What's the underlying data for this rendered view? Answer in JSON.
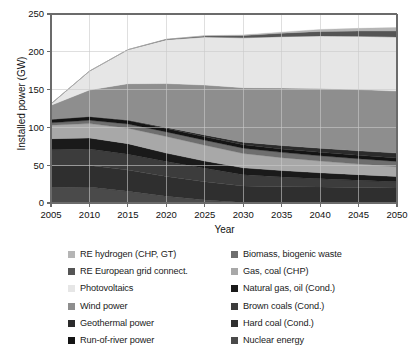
{
  "chart_data": {
    "type": "area",
    "stacked": true,
    "title": "",
    "xlabel": "Year",
    "ylabel": "Installed power (GW)",
    "xlim": [
      2005,
      2050
    ],
    "ylim": [
      0,
      250
    ],
    "yticks": [
      0,
      50,
      100,
      150,
      200,
      250
    ],
    "xticks": [
      2005,
      2010,
      2015,
      2020,
      2025,
      2030,
      2035,
      2040,
      2045,
      2050
    ],
    "grid": true,
    "legend_position": "below",
    "x": [
      2005,
      2010,
      2015,
      2020,
      2025,
      2030,
      2035,
      2040,
      2045,
      2050
    ],
    "series": [
      {
        "name": "Nuclear energy",
        "color": "#4a4a4a",
        "values": [
          20.5,
          21.0,
          15.5,
          9.0,
          4.0,
          0.5,
          0.0,
          0.0,
          0.0,
          0.0
        ]
      },
      {
        "name": "Hard coal (Cond.)",
        "color": "#2f2f2f",
        "values": [
          29.0,
          28.5,
          28.0,
          26.0,
          24.0,
          22.0,
          21.5,
          21.0,
          20.5,
          20.0
        ]
      },
      {
        "name": "Brown coals (Cond.)",
        "color": "#3c3c3c",
        "values": [
          21.0,
          22.0,
          21.0,
          20.0,
          18.0,
          15.0,
          13.0,
          11.0,
          9.5,
          8.0
        ]
      },
      {
        "name": "Natural gas, oil (Cond.)",
        "color": "#1a1a1a",
        "values": [
          14.5,
          14.5,
          14.0,
          11.0,
          9.5,
          9.0,
          8.5,
          8.0,
          7.5,
          7.0
        ]
      },
      {
        "name": "Gas, coal (CHP)",
        "color": "#a8a8a8",
        "values": [
          18.0,
          19.0,
          20.5,
          22.0,
          21.0,
          19.0,
          17.0,
          15.5,
          14.0,
          13.0
        ]
      },
      {
        "name": "Biomass, biogenic waste",
        "color": "#6e6e6e",
        "values": [
          3.0,
          4.5,
          5.5,
          6.0,
          6.5,
          7.0,
          7.0,
          7.0,
          7.0,
          7.0
        ]
      },
      {
        "name": "Run-of-river power",
        "color": "#141414",
        "values": [
          4.5,
          4.5,
          4.5,
          4.5,
          4.5,
          4.5,
          4.5,
          4.5,
          4.5,
          4.5
        ]
      },
      {
        "name": "Geothermal power",
        "color": "#2b2b2b",
        "values": [
          0.2,
          0.4,
          0.8,
          1.5,
          2.5,
          3.5,
          4.5,
          5.5,
          6.0,
          6.5
        ]
      },
      {
        "name": "Wind power",
        "color": "#8e8e8e",
        "values": [
          18.5,
          35.0,
          48.0,
          58.0,
          66.0,
          72.0,
          76.0,
          79.0,
          81.0,
          82.0
        ]
      },
      {
        "name": "Photovoltaics",
        "color": "#e6e6e6",
        "values": [
          2.0,
          25.0,
          45.0,
          58.0,
          63.5,
          66.0,
          68.0,
          69.5,
          70.5,
          71.5
        ]
      },
      {
        "name": "RE European grid connect.",
        "color": "#555555",
        "values": [
          0.0,
          0.0,
          0.0,
          0.5,
          1.5,
          3.0,
          4.5,
          6.0,
          7.0,
          8.0
        ]
      },
      {
        "name": "RE hydrogen (CHP, GT)",
        "color": "#b5b5b5",
        "values": [
          0.0,
          0.0,
          0.0,
          0.0,
          0.3,
          0.8,
          1.5,
          2.5,
          3.5,
          4.5
        ]
      }
    ],
    "totals": [
      151.2,
      174.4,
      202.8,
      216.5,
      221.3,
      218.3,
      222.0,
      225.0,
      227.0,
      228.0
    ]
  },
  "legend": {
    "left_column": [
      {
        "label": "RE hydrogen (CHP, GT)",
        "color": "#b5b5b5"
      },
      {
        "label": "RE European grid connect.",
        "color": "#555555"
      },
      {
        "label": "Photovoltaics",
        "color": "#e6e6e6"
      },
      {
        "label": "Wind power",
        "color": "#8e8e8e"
      },
      {
        "label": "Geothermal power",
        "color": "#2b2b2b"
      },
      {
        "label": "Run-of-river power",
        "color": "#141414"
      }
    ],
    "right_column": [
      {
        "label": "Biomass, biogenic waste",
        "color": "#6e6e6e"
      },
      {
        "label": "Gas, coal (CHP)",
        "color": "#a8a8a8"
      },
      {
        "label": "Natural gas, oil (Cond.)",
        "color": "#1a1a1a"
      },
      {
        "label": "Brown coals (Cond.)",
        "color": "#3c3c3c"
      },
      {
        "label": "Hard coal (Cond.)",
        "color": "#2f2f2f"
      },
      {
        "label": "Nuclear energy",
        "color": "#4a4a4a"
      }
    ]
  },
  "axes": {
    "y_title": "Installed power (GW)",
    "x_title": "Year",
    "y_tick_labels": [
      "0",
      "50",
      "100",
      "150",
      "200",
      "250"
    ],
    "x_tick_labels": [
      "2005",
      "2010",
      "2015",
      "2020",
      "2025",
      "2030",
      "2035",
      "2040",
      "2045",
      "2050"
    ]
  },
  "style": {
    "axis_color": "#6b6b6b",
    "grid_color": "#c9c9c9",
    "text_color": "#111111",
    "background": "#ffffff"
  }
}
